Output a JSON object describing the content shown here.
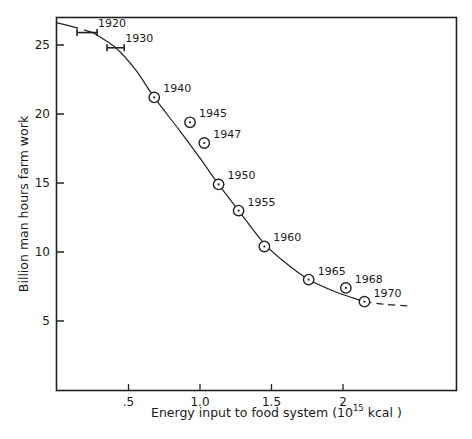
{
  "chart_data": {
    "type": "scatter",
    "title": "",
    "xlabel": "Energy input to food system (10^15 kcal )",
    "xlabel_parts": {
      "prefix": "Energy input to food system (10",
      "sup": "15",
      "suffix": " kcal )"
    },
    "ylabel": "Billion man hours farm work",
    "xlim": [
      0,
      2.8
    ],
    "ylim": [
      0,
      27
    ],
    "x_ticks": [
      {
        "value": 0.5,
        "label": ".5"
      },
      {
        "value": 1.0,
        "label": "1.0"
      },
      {
        "value": 1.5,
        "label": "1.5"
      },
      {
        "value": 2.0,
        "label": "2"
      }
    ],
    "y_ticks": [
      {
        "value": 5,
        "label": "5"
      },
      {
        "value": 10,
        "label": "10"
      },
      {
        "value": 15,
        "label": "15"
      },
      {
        "value": 20,
        "label": "20"
      },
      {
        "value": 25,
        "label": "25"
      }
    ],
    "grid": false,
    "legend": null,
    "series": [
      {
        "name": "Farm work vs energy input",
        "marker": "circled-dot",
        "points": [
          {
            "label": "1920",
            "x": 0.23,
            "y": 25.9,
            "x_range": [
              0.14,
              0.28
            ],
            "marker": "range-bar"
          },
          {
            "label": "1930",
            "x": 0.41,
            "y": 24.8,
            "x_range": [
              0.35,
              0.47
            ],
            "marker": "range-bar"
          },
          {
            "label": "1940",
            "x": 0.68,
            "y": 21.2
          },
          {
            "label": "1945",
            "x": 0.93,
            "y": 19.4
          },
          {
            "label": "1947",
            "x": 1.03,
            "y": 17.9
          },
          {
            "label": "1950",
            "x": 1.13,
            "y": 14.9
          },
          {
            "label": "1955",
            "x": 1.27,
            "y": 13.0
          },
          {
            "label": "1960",
            "x": 1.45,
            "y": 10.4
          },
          {
            "label": "1965",
            "x": 1.76,
            "y": 8.0
          },
          {
            "label": "1968",
            "x": 2.02,
            "y": 7.4
          },
          {
            "label": "1970",
            "x": 2.15,
            "y": 6.4
          }
        ]
      }
    ],
    "trend_curve": {
      "style": "solid, dashed extrapolations at both ends",
      "points": [
        [
          0.0,
          26.6
        ],
        [
          0.12,
          26.3
        ],
        [
          0.25,
          25.9
        ],
        [
          0.41,
          24.8
        ],
        [
          0.55,
          23.2
        ],
        [
          0.68,
          21.2
        ],
        [
          0.85,
          18.9
        ],
        [
          1.0,
          16.8
        ],
        [
          1.13,
          14.9
        ],
        [
          1.27,
          13.0
        ],
        [
          1.45,
          10.6
        ],
        [
          1.6,
          9.2
        ],
        [
          1.76,
          8.0
        ],
        [
          1.95,
          7.1
        ],
        [
          2.15,
          6.4
        ],
        [
          2.3,
          6.2
        ],
        [
          2.45,
          6.1
        ]
      ]
    }
  }
}
